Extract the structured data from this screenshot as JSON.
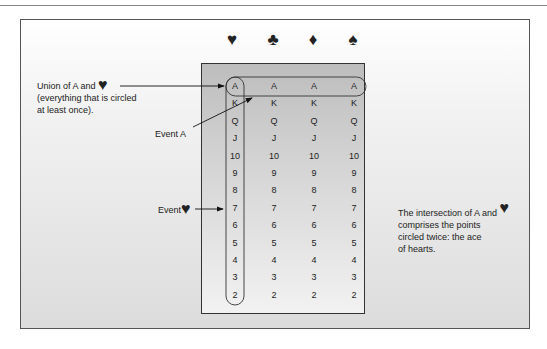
{
  "suits": [
    {
      "name": "hearts",
      "glyph": "♥",
      "x": 232
    },
    {
      "name": "clubs",
      "glyph": "♣",
      "x": 273
    },
    {
      "name": "diamonds",
      "glyph": "♦",
      "x": 313
    },
    {
      "name": "spades",
      "glyph": "♠",
      "x": 353
    }
  ],
  "ranks": [
    "A",
    "K",
    "Q",
    "J",
    "10",
    "9",
    "8",
    "7",
    "6",
    "5",
    "4",
    "3",
    "2"
  ],
  "columns_x": [
    235,
    274,
    314,
    354
  ],
  "row_start_y": 86,
  "row_step": 17.4,
  "labels": {
    "union_line1": "Union of A and",
    "union_heart": "♥",
    "union_line2": "(everything that is circled",
    "union_line3": "at least once).",
    "event_a": "Event A",
    "event_heart_text": "Event",
    "event_heart_glyph": "♥",
    "intersection_line1": "The intersection of A and",
    "intersection_heart": "♥",
    "intersection_line2": "comprises the points",
    "intersection_line3": "circled twice: the ace",
    "intersection_line4": "of hearts."
  },
  "colors": {
    "frame_border": "#555555",
    "inner_border": "#333333",
    "ink": "#222222"
  }
}
